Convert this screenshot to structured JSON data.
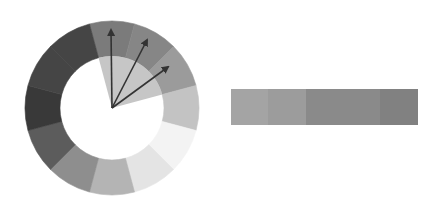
{
  "diagram": {
    "type": "color-wheel-analogous-scheme",
    "wheel": {
      "center": [
        112,
        108
      ],
      "outer_radius": 87,
      "inner_radius": 52,
      "segment_count": 12,
      "segment_colors": [
        "#7b7b7b",
        "#868686",
        "#9b9b9b",
        "#c3c3c3",
        "#f3f3f3",
        "#e4e4e4",
        "#b4b4b4",
        "#8e8e8e",
        "#5c5c5c",
        "#393939",
        "#454545",
        "#454545"
      ],
      "highlight_wedge": {
        "start_deg": -15,
        "end_deg": 75,
        "color": "#c6c6c6"
      }
    },
    "arrows": [
      {
        "name": "arrow-1",
        "tip": [
          111,
          30
        ]
      },
      {
        "name": "arrow-2",
        "tip": [
          147,
          40
        ]
      },
      {
        "name": "arrow-3",
        "tip": [
          168,
          67
        ]
      }
    ],
    "arrow_color": "#333333",
    "swatch_bar": {
      "swatches": [
        {
          "color": "#a4a4a4",
          "width": 37
        },
        {
          "color": "#9c9c9c",
          "width": 38
        },
        {
          "color": "#8a8a8a",
          "width": 74
        },
        {
          "color": "#818181",
          "width": 38
        }
      ]
    }
  }
}
